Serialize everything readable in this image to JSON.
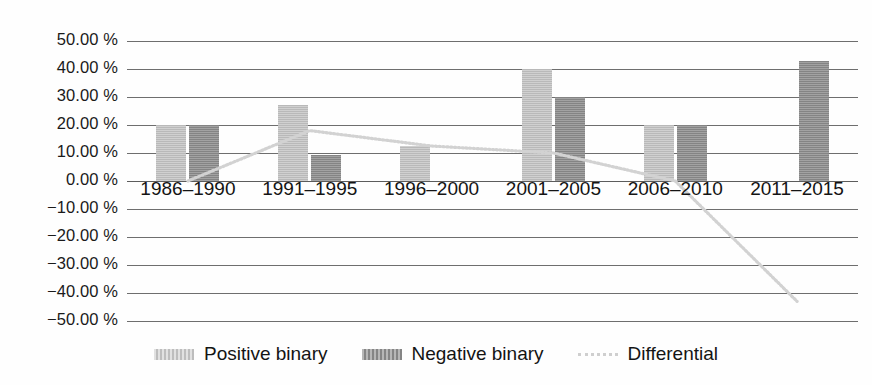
{
  "chart_data": {
    "type": "bar",
    "title": "",
    "subtitle": "",
    "xlabel": "",
    "ylabel": "",
    "categories": [
      "1986–1990",
      "1991–1995",
      "1996–2000",
      "2001–2005",
      "2006–2010",
      "2011–2015"
    ],
    "ylim": [
      -50,
      50
    ],
    "ytick_values": [
      50,
      40,
      30,
      20,
      10,
      0,
      -10,
      -20,
      -30,
      -40,
      -50
    ],
    "ytick_labels": [
      "50.00 %",
      "40.00 %",
      "30.00 %",
      "20.00 %",
      "10.00 %",
      "0.00 %",
      "−10.00 %",
      "−20.00 %",
      "−30.00 %",
      "−40.00 %",
      "−50.00 %"
    ],
    "grid": true,
    "legend_position": "bottom",
    "series": [
      {
        "name": "Positive binary",
        "type": "bar",
        "color": "#c3c3c3",
        "values": [
          20.0,
          27.0,
          12.5,
          40.0,
          20.0,
          0.0
        ]
      },
      {
        "name": "Negative binary",
        "type": "bar",
        "color": "#8e8e8e",
        "values": [
          20.0,
          9.3,
          0.0,
          30.0,
          20.0,
          43.0
        ]
      },
      {
        "name": "Differential",
        "type": "line",
        "color": "#d2d2d2",
        "linestyle": "dotted",
        "values": [
          0.0,
          18.0,
          12.5,
          10.0,
          0.0,
          -43.0
        ]
      }
    ]
  },
  "legend": {
    "items": [
      {
        "label": "Positive binary",
        "swatch": "bar-swatch-light"
      },
      {
        "label": "Negative binary",
        "swatch": "bar-swatch-dark"
      },
      {
        "label": "Differential",
        "swatch": "dotted-line-swatch"
      }
    ]
  }
}
